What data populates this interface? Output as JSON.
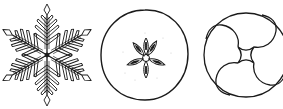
{
  "figures": [
    {
      "name": "snowflake",
      "label": "Snowflake"
    },
    {
      "name": "apple-cross-section",
      "label": "Apple cross-section"
    },
    {
      "name": "swirl-circle",
      "label": "Four-fold swirl in circle"
    }
  ],
  "colors": {
    "stroke": "#1a1a1a",
    "background": "#ffffff"
  }
}
